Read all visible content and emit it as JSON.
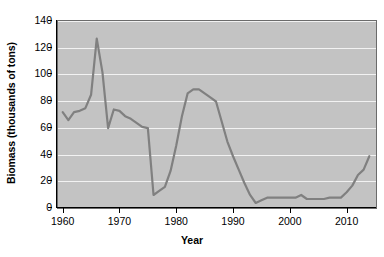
{
  "chart_data": {
    "type": "line",
    "title": "",
    "xlabel": "Year",
    "ylabel": "Biomass (thousands of tons)",
    "xlim": [
      1959,
      2015
    ],
    "ylim": [
      0,
      140
    ],
    "xticks": [
      1960,
      1970,
      1980,
      1990,
      2000,
      2010
    ],
    "yticks": [
      0,
      20,
      40,
      60,
      80,
      100,
      120,
      140
    ],
    "grid": "horizontal",
    "legend": "none",
    "plot_background_color": "#c3c3c3",
    "gridline_color": "#f2f2f2",
    "line_color": "#808080",
    "line_width": 2.2,
    "series": [
      {
        "name": "Biomass",
        "x": [
          1960,
          1961,
          1962,
          1963,
          1964,
          1965,
          1966,
          1967,
          1968,
          1969,
          1970,
          1971,
          1972,
          1973,
          1974,
          1975,
          1976,
          1977,
          1978,
          1979,
          1980,
          1981,
          1982,
          1983,
          1984,
          1985,
          1986,
          1987,
          1988,
          1989,
          1990,
          1991,
          1992,
          1993,
          1994,
          1995,
          1996,
          1997,
          1998,
          1999,
          2000,
          2001,
          2002,
          2003,
          2004,
          2005,
          2006,
          2007,
          2008,
          2009,
          2010,
          2011,
          2012,
          2013,
          2014
        ],
        "y": [
          71,
          65,
          71,
          72,
          74,
          84,
          126,
          101,
          59,
          73,
          72,
          68,
          66,
          63,
          60,
          59,
          9,
          12,
          15,
          27,
          46,
          68,
          85,
          88,
          88,
          85,
          82,
          79,
          64,
          49,
          38,
          28,
          18,
          9,
          3,
          5,
          7,
          7,
          7,
          7,
          7,
          7,
          9,
          6,
          6,
          6,
          6,
          7,
          7,
          7,
          11,
          16,
          24,
          28,
          38
        ]
      }
    ]
  }
}
